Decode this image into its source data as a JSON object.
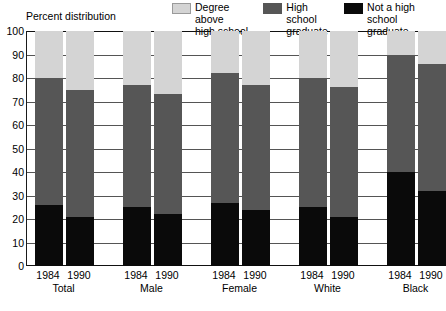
{
  "chart_data": {
    "type": "bar",
    "subtype": "stacked-100-percent",
    "title": "",
    "axis_note": "Percent distribution",
    "xlabel": "",
    "ylabel": "",
    "ylim": [
      0,
      100
    ],
    "yticks": [
      0,
      10,
      20,
      30,
      40,
      50,
      60,
      70,
      80,
      90,
      100
    ],
    "grid": true,
    "legend_position": "top-right",
    "categories": [
      "Total 1984",
      "Total 1990",
      "Male 1984",
      "Male 1990",
      "Female 1984",
      "Female 1990",
      "White 1984",
      "White 1990",
      "Black 1984",
      "Black 1990",
      "Hispanic (of any race) 1990"
    ],
    "series": [
      {
        "name": "Not a high school graduate",
        "color": "#0a0a0a",
        "values": [
          26,
          21,
          25,
          22,
          27,
          24,
          25,
          21,
          40,
          32,
          44
        ]
      },
      {
        "name": "High school graduate",
        "color": "#565656",
        "values": [
          54,
          54,
          52,
          51,
          55,
          53,
          55,
          55,
          50,
          54,
          45
        ]
      },
      {
        "name": "Degree above high school",
        "color": "#d4d4d4",
        "values": [
          20,
          25,
          23,
          27,
          18,
          23,
          20,
          24,
          10,
          14,
          11
        ]
      }
    ],
    "groups": [
      {
        "name": "Total",
        "years": [
          "1984",
          "1990"
        ]
      },
      {
        "name": "Male",
        "years": [
          "1984",
          "1990"
        ]
      },
      {
        "name": "Female",
        "years": [
          "1984",
          "1990"
        ]
      },
      {
        "name": "White",
        "years": [
          "1984",
          "1990"
        ]
      },
      {
        "name": "Black",
        "years": [
          "1984",
          "1990"
        ]
      },
      {
        "name": "Hispanic\n(of any race)",
        "years": [
          "1990"
        ]
      }
    ]
  },
  "legend": {
    "items": [
      {
        "label": "Degree above\nhigh school",
        "swatch": "light-gray-swatch",
        "color": "#d4d4d4"
      },
      {
        "label": "High school\ngraduate",
        "swatch": "dark-gray-swatch",
        "color": "#565656"
      },
      {
        "label": "Not a high school\ngraduate",
        "swatch": "black-swatch",
        "color": "#0a0a0a"
      }
    ]
  },
  "axis": {
    "percent_note": "Percent distribution",
    "ytick_labels": [
      "100",
      "90",
      "80",
      "70",
      "60",
      "50",
      "40",
      "30",
      "20",
      "10",
      "0"
    ]
  },
  "xaxis": {
    "year_labels": [
      "1984",
      "1990",
      "1984",
      "1990",
      "1984",
      "1990",
      "1984",
      "1990",
      "1984",
      "1990",
      "1990"
    ],
    "group_labels": [
      "Total",
      "Male",
      "Female",
      "White",
      "Black",
      "Hispanic\n(of any race)"
    ]
  }
}
